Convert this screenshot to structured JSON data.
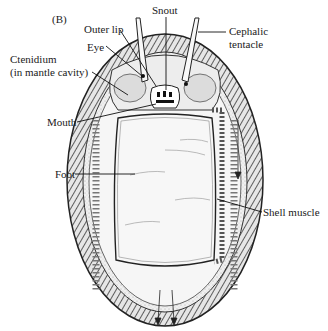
{
  "figure": {
    "panel_label": "(B)"
  },
  "labels": {
    "snout": "Snout",
    "outer_lip": "Outer lip",
    "cephalic_tentacle_line1": "Cephalic",
    "cephalic_tentacle_line2": "tentacle",
    "eye": "Eye",
    "ctenidium_line1": "Ctenidium",
    "ctenidium_line2": "(in mantle cavity)",
    "mouth": "Mouth",
    "foot": "Foot",
    "shell_muscle": "Shell muscle"
  },
  "colors": {
    "ink": "#1a1a1a",
    "background": "#ffffff",
    "shading": "#9a9a9a",
    "girdle_fill": "#d8d8d8",
    "foot_fill": "#f4f4f4"
  }
}
